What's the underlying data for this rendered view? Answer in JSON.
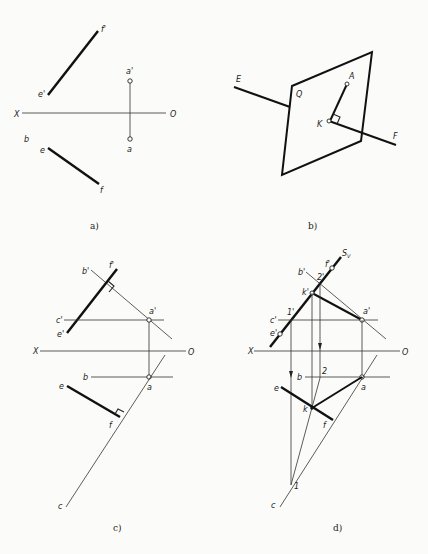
{
  "panels": {
    "a": {
      "caption": "a)",
      "labels": {
        "f_prime": "f'",
        "e_prime": "e'",
        "a_prime": "a'",
        "X": "X",
        "O": "O",
        "b": "b",
        "e": "e",
        "a": "a",
        "f": "f"
      }
    },
    "b": {
      "caption": "b)",
      "labels": {
        "E": "E",
        "Q": "Q",
        "A": "A",
        "K": "K",
        "F": "F"
      }
    },
    "c": {
      "caption": "c)",
      "labels": {
        "b_prime": "b'",
        "f_prime": "f'",
        "a_prime": "a'",
        "c_prime": "c'",
        "e_prime": "e'",
        "X": "X",
        "O": "O",
        "b": "b",
        "a": "a",
        "e": "e",
        "f": "f",
        "c": "c"
      }
    },
    "d": {
      "caption": "d)",
      "labels": {
        "Sv": "S",
        "Sv_sub": "V",
        "b_prime": "b'",
        "two_prime": "2'",
        "f_prime": "f'",
        "k_prime": "k'",
        "one_prime": "1'",
        "c_prime": "c'",
        "e_prime": "e'",
        "a_prime": "a'",
        "X": "X",
        "O": "O",
        "b": "b",
        "two": "2",
        "e": "e",
        "a": "a",
        "k": "k",
        "f": "f",
        "one": "1",
        "c": "c"
      }
    }
  }
}
